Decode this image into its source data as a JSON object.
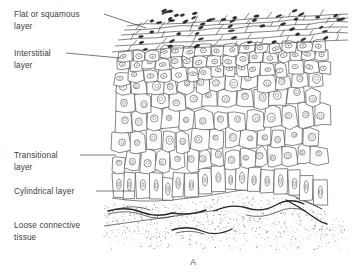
{
  "figure": {
    "letter": "A",
    "line_color": "#3c3c3c",
    "text_color": "#3b3b3b",
    "background": "#ffffff"
  },
  "labels": [
    {
      "id": "flat-or-squamous-layer",
      "lines": [
        "Flat or squamous",
        "layer"
      ],
      "x": 14,
      "y": 17,
      "leader": "M 104 14 L 146 28"
    },
    {
      "id": "interstitial-layer",
      "lines": [
        "Interstitial",
        "layer"
      ],
      "x": 14,
      "y": 56,
      "leader": "M 66 53 L 120 58"
    },
    {
      "id": "transitional-layer",
      "lines": [
        "Transitional",
        "layer"
      ],
      "x": 14,
      "y": 158,
      "leader": "M 80 155 L 116 155"
    },
    {
      "id": "cylindrical-layer",
      "lines": [
        "Cylindrical layer"
      ],
      "x": 14,
      "y": 194,
      "leader": "M 96 191 L 134 191"
    },
    {
      "id": "loose-connective-tissue",
      "lines": [
        "Loose connective",
        "tissue"
      ],
      "x": 14,
      "y": 228,
      "leader": "M 104 226 L 218 210"
    }
  ],
  "regions": [
    {
      "id": "flat-squamous-zone",
      "name": "Flat or squamous layer",
      "y_top": 24,
      "y_bottom": 56
    },
    {
      "id": "interstitial-zone",
      "name": "Interstitial layer",
      "y_top": 56,
      "y_bottom": 86
    },
    {
      "id": "transitional-zone",
      "name": "Transitional layer",
      "y_top": 86,
      "y_bottom": 175
    },
    {
      "id": "cylindrical-zone",
      "name": "Cylindrical layer",
      "y_top": 175,
      "y_bottom": 200
    },
    {
      "id": "connective-tissue-zone",
      "name": "Loose connective tissue",
      "y_top": 200,
      "y_bottom": 250
    }
  ]
}
